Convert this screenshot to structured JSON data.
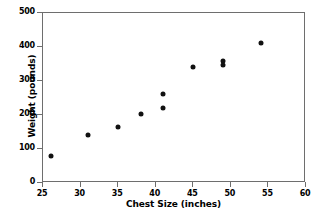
{
  "chart_data": {
    "type": "scatter",
    "title": "",
    "xlabel": "Chest Size (inches)",
    "ylabel": "Weight (pounds)",
    "xlim": [
      25,
      60
    ],
    "ylim": [
      0,
      500
    ],
    "xticks": [
      25,
      30,
      35,
      40,
      45,
      50,
      55,
      60
    ],
    "yticks": [
      0,
      100,
      200,
      300,
      400,
      500
    ],
    "grid": false,
    "legend": null,
    "series": [
      {
        "name": "Bears",
        "marker": "filled-circle",
        "color": "#111111",
        "x": [
          26,
          31,
          35,
          38,
          41,
          41,
          45,
          49,
          49,
          54
        ],
        "y": [
          79,
          141,
          165,
          204,
          220,
          262,
          342,
          348,
          358,
          413
        ],
        "points": [
          {
            "x": 26,
            "y": 79
          },
          {
            "x": 31,
            "y": 141
          },
          {
            "x": 35,
            "y": 165
          },
          {
            "x": 38,
            "y": 204
          },
          {
            "x": 41,
            "y": 220
          },
          {
            "x": 41,
            "y": 262
          },
          {
            "x": 45,
            "y": 342
          },
          {
            "x": 49,
            "y": 348
          },
          {
            "x": 49,
            "y": 358
          },
          {
            "x": 54,
            "y": 413
          }
        ]
      }
    ]
  },
  "figure": {
    "background_color": "#ffffff",
    "axis_color": "#6e6e6e",
    "marker_color": "#111111"
  }
}
